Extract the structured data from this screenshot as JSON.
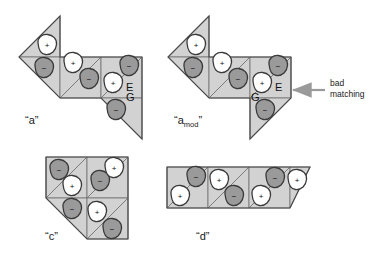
{
  "figure": {
    "background_color": "#ffffff",
    "palette": {
      "tile_fill": "#d2d2d2",
      "tile_edge": "#6e6e6e",
      "outline": "#4a4a4a",
      "blob_plus_fill": "#ffffff",
      "blob_minus_fill": "#9a9a9a",
      "blob_stroke": "#3a3a3a",
      "arrow_color": "#9a9a9a",
      "text_color": "#1a1a1a"
    },
    "sign_plus": "+",
    "sign_minus": "−"
  },
  "shapes": [
    {
      "id": "shape-a",
      "caption": "“a”",
      "caption_sub": "",
      "tile_letters": [
        {
          "text": "E",
          "x": 126,
          "y": 91
        },
        {
          "text": "G",
          "x": 126,
          "y": 101
        }
      ],
      "tiles": [
        {
          "sign": "+",
          "cx": 47,
          "cy": 45
        },
        {
          "sign": "−",
          "cx": 44,
          "cy": 68
        },
        {
          "sign": "+",
          "cx": 73,
          "cy": 63
        },
        {
          "sign": "−",
          "cx": 89,
          "cy": 79
        },
        {
          "sign": "+",
          "cx": 113,
          "cy": 83
        },
        {
          "sign": "−",
          "cx": 129,
          "cy": 66
        },
        {
          "sign": "−",
          "cx": 116,
          "cy": 110
        }
      ]
    },
    {
      "id": "shape-amod",
      "caption": "“a",
      "caption_sub": "mod",
      "caption_close": "”",
      "tile_letters": [
        {
          "text": "E",
          "x": 275,
          "y": 91
        },
        {
          "text": "G",
          "x": 251,
          "y": 101
        }
      ],
      "tiles": [
        {
          "sign": "+",
          "cx": 196,
          "cy": 45
        },
        {
          "sign": "−",
          "cx": 193,
          "cy": 68
        },
        {
          "sign": "+",
          "cx": 222,
          "cy": 63
        },
        {
          "sign": "−",
          "cx": 238,
          "cy": 79
        },
        {
          "sign": "+",
          "cx": 262,
          "cy": 83
        },
        {
          "sign": "−",
          "cx": 278,
          "cy": 66
        },
        {
          "sign": "−",
          "cx": 265,
          "cy": 110
        }
      ]
    },
    {
      "id": "shape-c",
      "caption": "“c”",
      "caption_sub": "",
      "tile_letters": [],
      "tiles": [
        {
          "sign": "−",
          "cx": 59,
          "cy": 170
        },
        {
          "sign": "+",
          "cx": 72,
          "cy": 186
        },
        {
          "sign": "−",
          "cx": 100,
          "cy": 181
        },
        {
          "sign": "+",
          "cx": 114,
          "cy": 168
        },
        {
          "sign": "−",
          "cx": 72,
          "cy": 209
        },
        {
          "sign": "+",
          "cx": 97,
          "cy": 212
        },
        {
          "sign": "−",
          "cx": 112,
          "cy": 229
        }
      ]
    },
    {
      "id": "shape-d",
      "caption": "“d”",
      "caption_sub": "",
      "tile_letters": [],
      "tiles": [
        {
          "sign": "+",
          "cx": 180,
          "cy": 196
        },
        {
          "sign": "−",
          "cx": 196,
          "cy": 177
        },
        {
          "sign": "+",
          "cx": 219,
          "cy": 180
        },
        {
          "sign": "−",
          "cx": 232,
          "cy": 196
        },
        {
          "sign": "+",
          "cx": 258,
          "cy": 196
        },
        {
          "sign": "−",
          "cx": 272,
          "cy": 178
        },
        {
          "sign": "+",
          "cx": 296,
          "cy": 180
        }
      ]
    }
  ],
  "annotations": [
    {
      "id": "bad-matching",
      "line1": "bad",
      "line2": "matching",
      "text_x": 330,
      "text_y": 86,
      "arrow_from_x": 325,
      "arrow_to_x": 291,
      "arrow_y": 90
    }
  ],
  "captions": {
    "a": {
      "x": 25,
      "y": 124
    },
    "amod": {
      "x": 174,
      "y": 124
    },
    "c": {
      "x": 45,
      "y": 240
    },
    "d": {
      "x": 196,
      "y": 240
    }
  }
}
